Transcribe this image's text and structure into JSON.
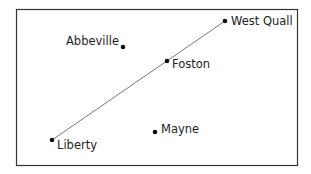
{
  "diagram": {
    "towns": [
      {
        "name": "West Quall",
        "x": 225,
        "y": 21,
        "lx": 231,
        "ly": 25
      },
      {
        "name": "Abbeville",
        "x": 123,
        "y": 47,
        "lx": 66,
        "ly": 45
      },
      {
        "name": "Foston",
        "x": 167,
        "y": 61,
        "lx": 172,
        "ly": 68
      },
      {
        "name": "Mayne",
        "x": 155,
        "y": 132,
        "lx": 161,
        "ly": 133
      },
      {
        "name": "Liberty",
        "x": 52,
        "y": 140,
        "lx": 57,
        "ly": 149
      }
    ],
    "line": {
      "from": "Liberty",
      "to": "West Quall"
    }
  }
}
